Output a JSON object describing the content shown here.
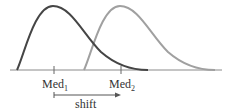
{
  "diagram": {
    "type": "distribution-shift",
    "curves": [
      {
        "name": "distribution-1",
        "color": "#454545",
        "peak_x": 53,
        "median_x": 54
      },
      {
        "name": "distribution-2",
        "color": "#a0a0a0",
        "peak_x": 121,
        "median_x": 121
      }
    ],
    "labels": {
      "med1_base": "Med",
      "med1_sub": "1",
      "med2_base": "Med",
      "med2_sub": "2",
      "shift": "shift"
    }
  }
}
